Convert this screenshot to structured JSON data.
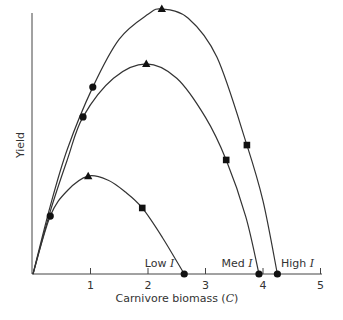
{
  "chart_data": {
    "type": "line",
    "title": "",
    "xlabel": "Carnivore biomass (C)",
    "ylabel": "Yield",
    "xlim": [
      0,
      5
    ],
    "ylim": [
      0,
      100
    ],
    "x_ticks": [
      "1",
      "2",
      "3",
      "4",
      "5"
    ],
    "grid": false,
    "legend": "none",
    "region_labels": [
      {
        "text": "Low",
        "symbol": "I",
        "x": 2.2
      },
      {
        "text": "Med",
        "symbol": "I",
        "x": 3.55
      },
      {
        "text": "High",
        "symbol": "I",
        "x": 4.6
      }
    ],
    "series": [
      {
        "name": "High I",
        "curve": [
          [
            0,
            0
          ],
          [
            0.3,
            26
          ],
          [
            0.6,
            48
          ],
          [
            1.04,
            71.6
          ],
          [
            1.5,
            90
          ],
          [
            2.0,
            99.5
          ],
          [
            2.24,
            101.5
          ],
          [
            2.7,
            98
          ],
          [
            3.2,
            83
          ],
          [
            3.72,
            49.4
          ],
          [
            4.0,
            28
          ],
          [
            4.25,
            0
          ]
        ],
        "markers": [
          {
            "shape": "circle",
            "x": 1.04,
            "y": 71.6
          },
          {
            "shape": "triangle",
            "x": 2.24,
            "y": 101.5
          },
          {
            "shape": "square",
            "x": 3.72,
            "y": 49.4
          },
          {
            "shape": "circle",
            "x": 4.25,
            "y": 0
          }
        ]
      },
      {
        "name": "Med I",
        "curve": [
          [
            0,
            0
          ],
          [
            0.3,
            24
          ],
          [
            0.6,
            44
          ],
          [
            0.87,
            60.2
          ],
          [
            1.4,
            75
          ],
          [
            1.97,
            80.5
          ],
          [
            2.5,
            75
          ],
          [
            3.0,
            60
          ],
          [
            3.36,
            43.7
          ],
          [
            3.7,
            22
          ],
          [
            3.93,
            0
          ]
        ],
        "markers": [
          {
            "shape": "circle",
            "x": 0.87,
            "y": 60.2
          },
          {
            "shape": "triangle",
            "x": 1.97,
            "y": 80.5
          },
          {
            "shape": "square",
            "x": 3.36,
            "y": 43.7
          },
          {
            "shape": "circle",
            "x": 3.93,
            "y": 0
          }
        ]
      },
      {
        "name": "Low I",
        "curve": [
          [
            0,
            0
          ],
          [
            0.3,
            22.2
          ],
          [
            0.6,
            32
          ],
          [
            0.96,
            37.5
          ],
          [
            1.3,
            36
          ],
          [
            1.6,
            31.5
          ],
          [
            1.9,
            25.3
          ],
          [
            2.25,
            14
          ],
          [
            2.63,
            0
          ]
        ],
        "markers": [
          {
            "shape": "circle",
            "x": 0.3,
            "y": 22.2
          },
          {
            "shape": "triangle",
            "x": 0.96,
            "y": 37.5
          },
          {
            "shape": "square",
            "x": 1.9,
            "y": 25.3
          },
          {
            "shape": "circle",
            "x": 2.63,
            "y": 0
          }
        ]
      }
    ]
  }
}
